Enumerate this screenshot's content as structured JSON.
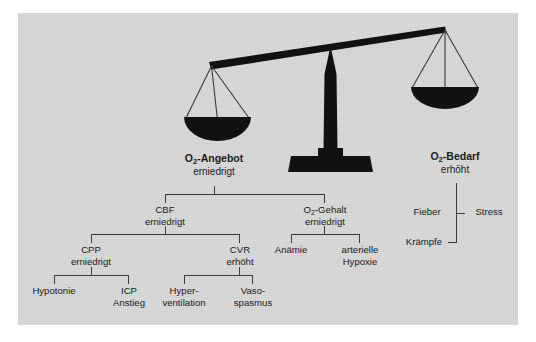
{
  "figure": {
    "panel_color": "#d7d7d7",
    "ink_color": "#111111",
    "background": "#ffffff"
  },
  "balance": {
    "name": "balance-scale",
    "tilt": "left-side-down",
    "left_pan_label": "O2-Angebot",
    "right_pan_label": "O2-Bedarf"
  },
  "supply": {
    "title_main": "O",
    "title_sub": "2",
    "title_rest": "-Angebot",
    "title_plain": "O2-Angebot",
    "state": "erniedrigt"
  },
  "demand": {
    "title_main": "O",
    "title_sub": "2",
    "title_rest": "-Bedarf",
    "title_plain": "O2-Bedarf",
    "state": "erhöht"
  },
  "demand_factors": {
    "left": "Fieber",
    "right": "Stress",
    "bottom": "Krämpfe"
  },
  "supply_branches": [
    {
      "id": "cbf",
      "label": "CBF",
      "state": "erniedrigt",
      "children": [
        {
          "id": "cpp",
          "label": "CPP",
          "state": "erniedrigt",
          "children": [
            {
              "id": "hypotonie",
              "label": "Hypotonie",
              "line2": ""
            },
            {
              "id": "icp",
              "label": "ICP",
              "line2": "Anstieg"
            }
          ]
        },
        {
          "id": "cvr",
          "label": "CVR",
          "state": "erhöht",
          "children": [
            {
              "id": "hyperventilation",
              "label": "Hyper-",
              "line2": "ventilation"
            },
            {
              "id": "vasospasmus",
              "label": "Vaso-",
              "line2": "spasmus"
            }
          ]
        }
      ]
    },
    {
      "id": "o2gehalt",
      "label_main": "O",
      "label_sub": "2",
      "label_rest": "-Gehalt",
      "label": "O2-Gehalt",
      "state": "erniedrigt",
      "children": [
        {
          "id": "anaemie",
          "label": "Anämie",
          "line2": ""
        },
        {
          "id": "hypoxie",
          "label": "arterielle",
          "line2": "Hypoxie"
        }
      ]
    }
  ]
}
